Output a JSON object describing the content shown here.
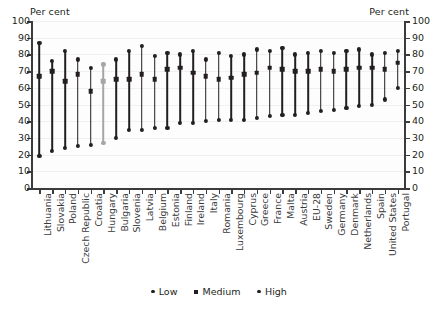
{
  "axis_titles": {
    "left": "Per cent",
    "right": "Per cent"
  },
  "legend": [
    {
      "key": "low",
      "label": "Low",
      "marker": "dot"
    },
    {
      "key": "medium",
      "label": "Medium",
      "marker": "sq"
    },
    {
      "key": "high",
      "label": "High",
      "marker": "dot"
    }
  ],
  "footnote": "",
  "colors": {
    "series": "#231f20",
    "highlight": "#a6a6a6",
    "axis": "#3c3c3c",
    "grid": "#f0f0f0"
  },
  "highlight_category": "Hungary",
  "chart_data": {
    "type": "scatter",
    "title": "",
    "subtitle": "",
    "xlabel": "",
    "ylabel": "Per cent",
    "y2label": "Per cent",
    "ylim": [
      0,
      100
    ],
    "yticks": [
      0,
      10,
      20,
      30,
      40,
      50,
      60,
      70,
      80,
      90,
      100
    ],
    "ytick_labels": [
      "0",
      "10",
      "20",
      "30",
      "40",
      "50",
      "60",
      "70",
      "80",
      "90",
      "100"
    ],
    "grid": true,
    "legend_position": "bottom",
    "categories": [
      "Lithuania",
      "Slovakia",
      "Poland",
      "Czech Republic",
      "Croatia",
      "Hungary",
      "Bulgaria",
      "Slovenia",
      "Latvia",
      "Belgium",
      "Estonia",
      "Finland",
      "Ireland",
      "Italy",
      "Romania",
      "Luxembourg",
      "Cyprus",
      "Greece",
      "France",
      "Malta",
      "Austria",
      "EU-28",
      "Sweden",
      "Germany",
      "Denmark",
      "Netherlands",
      "Spain",
      "United States",
      "Portugal"
    ],
    "series": [
      {
        "name": "Low",
        "values": [
          19,
          22,
          24,
          25,
          26,
          27,
          30,
          35,
          35,
          36,
          36,
          39,
          39,
          40,
          41,
          41,
          41,
          42,
          43,
          44,
          44,
          45,
          46,
          47,
          48,
          49,
          50,
          53,
          60
        ]
      },
      {
        "name": "Medium",
        "values": [
          67,
          70,
          64,
          68,
          58,
          64,
          65,
          65,
          68,
          65,
          71,
          72,
          69,
          67,
          65,
          66,
          68,
          69,
          72,
          71,
          70,
          70,
          71,
          70,
          71,
          72,
          72,
          71,
          75
        ]
      },
      {
        "name": "High",
        "values": [
          87,
          76,
          82,
          77,
          72,
          74,
          77,
          82,
          85,
          79,
          81,
          80,
          82,
          77,
          81,
          79,
          80,
          83,
          82,
          84,
          80,
          81,
          82,
          81,
          82,
          83,
          80,
          81,
          82
        ]
      }
    ]
  }
}
